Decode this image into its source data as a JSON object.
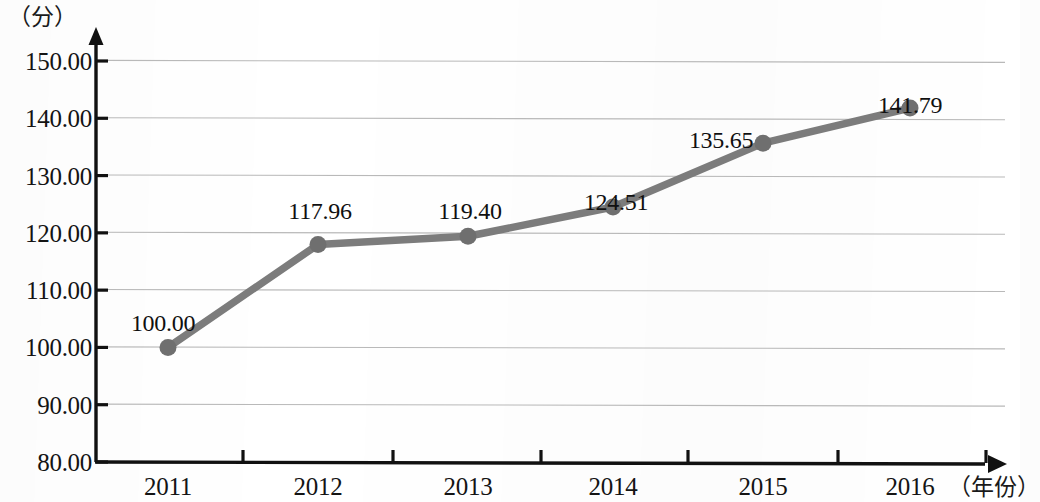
{
  "chart_data": {
    "type": "line",
    "title": "",
    "subtitle": "",
    "xlabel": "（年份）",
    "ylabel": "（分）",
    "categories": [
      "2011",
      "2012",
      "2013",
      "2014",
      "2015",
      "2016"
    ],
    "series": [
      {
        "name": "",
        "values": [
          100.0,
          117.96,
          119.4,
          124.51,
          135.65,
          141.79
        ],
        "point_labels": [
          "100.00",
          "117.96",
          "119.40",
          "124.51",
          "135.65",
          "141.79"
        ],
        "line_color": "#7c7c7c",
        "marker_color": "#6f6f6f",
        "marker": "circle"
      }
    ],
    "ylim": [
      80,
      150
    ],
    "ytick_labels": [
      "150.00",
      "140.00",
      "130.00",
      "120.00",
      "110.00",
      "100.00",
      "90.00",
      "80.00"
    ],
    "ytick_values": [
      150,
      140,
      130,
      120,
      110,
      100,
      90,
      80
    ],
    "xtick_labels": [
      "2011",
      "2012",
      "2013",
      "2014",
      "2015",
      "2016"
    ],
    "grid": true,
    "grid_axis": "y",
    "grid_color": "#b9b9b9",
    "legend": "none",
    "axis_color": "#111111",
    "axis_arrows": true
  },
  "colors": {
    "line": "#7c7c7c",
    "marker": "#6f6f6f",
    "grid": "#b9b9b9",
    "axis": "#111111",
    "text": "#121212",
    "background": "#ffffff"
  }
}
